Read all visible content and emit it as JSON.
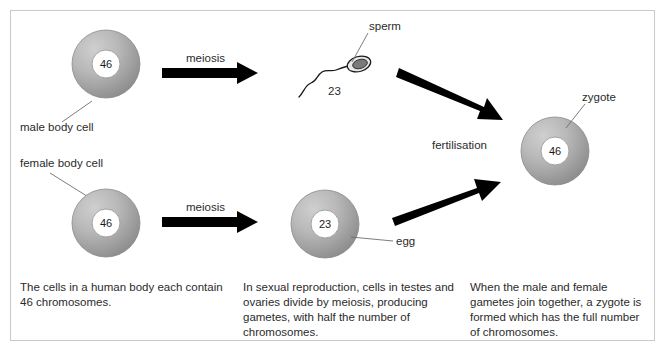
{
  "diagram": {
    "frame": {
      "stroke_color": "#c9c9c9"
    },
    "background_color": "#ffffff"
  },
  "cells": {
    "male_body_cell": {
      "label": "male body cell",
      "chromosome_count": "46",
      "cx": 106,
      "cy": 64,
      "r": 34,
      "nucleus_r": 14
    },
    "female_body_cell": {
      "label": "female body cell",
      "chromosome_count": "46",
      "cx": 106,
      "cy": 223,
      "r": 34,
      "nucleus_r": 14
    },
    "egg_cell": {
      "label": "egg",
      "chromosome_count": "23",
      "cx": 325,
      "cy": 224,
      "r": 34,
      "nucleus_r": 14
    },
    "zygote_cell": {
      "label": "zygote",
      "chromosome_count": "46",
      "cx": 555,
      "cy": 151,
      "r": 34,
      "nucleus_r": 14
    },
    "sperm_cell": {
      "label": "sperm",
      "chromosome_count": "23"
    }
  },
  "processes": {
    "meiosis_top": "meiosis",
    "meiosis_bottom": "meiosis",
    "fertilisation": "fertilisation"
  },
  "captions": {
    "left": "The cells in a human body each contain 46 chromosomes.",
    "middle": "In sexual reproduction, cells in testes and ovaries divide by meiosis, producing gametes, with half the number of chromosomes.",
    "right": "When the male and female gametes join together, a zygote is formed which has the full number of chromosomes."
  },
  "colors": {
    "cell_light": "#c2c2c2",
    "cell_dark": "#8f8f8f",
    "cell_outline": "#8a8a8a",
    "text": "#2b2b2b",
    "arrow": "#000000",
    "frame": "#c9c9c9"
  }
}
